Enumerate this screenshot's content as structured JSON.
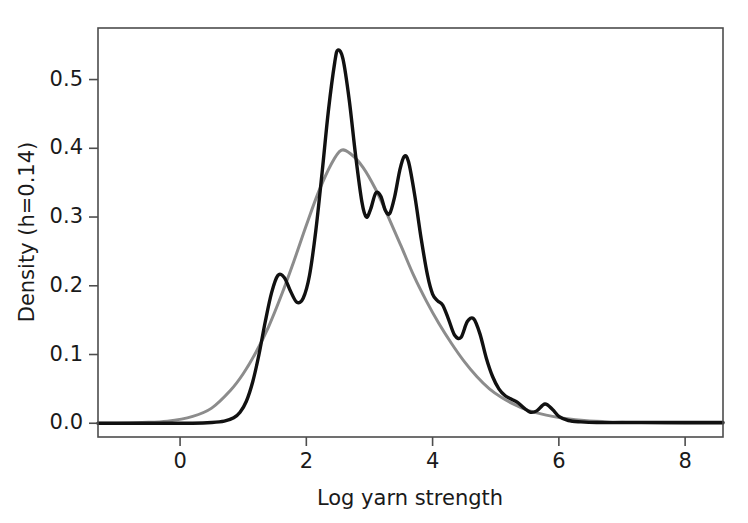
{
  "chart_data": {
    "type": "line",
    "title": "",
    "xlabel": "Log yarn strength",
    "ylabel": "Density (h=0.14)",
    "xlim": [
      -1.3,
      8.6
    ],
    "ylim": [
      -0.02,
      0.575
    ],
    "xticks": [
      0,
      2,
      4,
      6,
      8
    ],
    "xticklabels": [
      "0",
      "2",
      "4",
      "6",
      "8"
    ],
    "yticks": [
      0.0,
      0.1,
      0.2,
      0.3,
      0.4,
      0.5
    ],
    "yticklabels": [
      "0.0",
      "0.1",
      "0.2",
      "0.3",
      "0.4",
      "0.5"
    ],
    "grid": false,
    "legend": "none",
    "colors": {
      "kde_curve": "#111111",
      "reference_curve": "#8c8c8c",
      "axis": "#4d4d4d",
      "background": "#ffffff"
    },
    "series": [
      {
        "name": "Kernel density estimate (h=0.14)",
        "color": "#111111",
        "x": [
          -1.3,
          -1.0,
          -0.6,
          -0.2,
          0.2,
          0.5,
          0.7,
          0.85,
          0.95,
          1.05,
          1.15,
          1.25,
          1.35,
          1.45,
          1.55,
          1.65,
          1.75,
          1.85,
          1.95,
          2.05,
          2.15,
          2.25,
          2.35,
          2.45,
          2.5,
          2.58,
          2.68,
          2.78,
          2.88,
          2.95,
          3.02,
          3.1,
          3.18,
          3.25,
          3.32,
          3.4,
          3.48,
          3.55,
          3.62,
          3.72,
          3.82,
          3.92,
          4.0,
          4.08,
          4.16,
          4.25,
          4.35,
          4.45,
          4.55,
          4.65,
          4.75,
          4.85,
          4.95,
          5.05,
          5.15,
          5.25,
          5.35,
          5.45,
          5.55,
          5.65,
          5.78,
          5.9,
          6.0,
          6.15,
          6.35,
          6.6,
          7.0,
          7.5,
          8.0,
          8.6
        ],
        "y": [
          0.0,
          0.0,
          0.0,
          0.0,
          0.0,
          0.001,
          0.003,
          0.008,
          0.016,
          0.032,
          0.06,
          0.1,
          0.148,
          0.19,
          0.215,
          0.212,
          0.192,
          0.176,
          0.182,
          0.215,
          0.28,
          0.365,
          0.455,
          0.525,
          0.543,
          0.53,
          0.47,
          0.39,
          0.322,
          0.3,
          0.312,
          0.335,
          0.33,
          0.31,
          0.305,
          0.33,
          0.368,
          0.388,
          0.38,
          0.33,
          0.268,
          0.215,
          0.188,
          0.178,
          0.172,
          0.152,
          0.128,
          0.125,
          0.148,
          0.152,
          0.13,
          0.095,
          0.068,
          0.05,
          0.04,
          0.035,
          0.03,
          0.022,
          0.016,
          0.018,
          0.028,
          0.02,
          0.01,
          0.004,
          0.002,
          0.001,
          0.001,
          0.001,
          0.001,
          0.001
        ]
      },
      {
        "name": "Smooth reference density",
        "color": "#8c8c8c",
        "x": [
          -1.3,
          -1.0,
          -0.6,
          -0.2,
          0.2,
          0.5,
          0.8,
          1.0,
          1.2,
          1.4,
          1.6,
          1.8,
          2.0,
          2.2,
          2.4,
          2.55,
          2.7,
          2.9,
          3.1,
          3.3,
          3.5,
          3.7,
          3.9,
          4.1,
          4.3,
          4.5,
          4.7,
          4.9,
          5.1,
          5.3,
          5.5,
          5.7,
          5.9,
          6.1,
          6.4,
          6.8,
          7.3,
          8.0,
          8.6
        ],
        "y": [
          0.0,
          0.0,
          0.001,
          0.003,
          0.01,
          0.022,
          0.048,
          0.072,
          0.103,
          0.14,
          0.185,
          0.235,
          0.288,
          0.338,
          0.378,
          0.397,
          0.392,
          0.372,
          0.34,
          0.3,
          0.258,
          0.215,
          0.178,
          0.145,
          0.116,
          0.09,
          0.068,
          0.05,
          0.037,
          0.027,
          0.019,
          0.014,
          0.01,
          0.007,
          0.004,
          0.002,
          0.001,
          0.0,
          0.0
        ]
      }
    ]
  }
}
